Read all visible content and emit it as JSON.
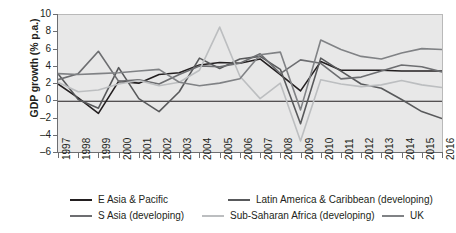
{
  "chart_data": {
    "type": "line",
    "title": "",
    "xlabel": "",
    "ylabel": "GDP growth (% p.a.)",
    "ylim": [
      -6,
      10
    ],
    "yticks": [
      10,
      8,
      6,
      4,
      2,
      0,
      -2,
      -4,
      -6
    ],
    "ytick_labels": [
      "10",
      "8",
      "6",
      "4",
      "2",
      "0",
      "–2",
      "–4",
      "–6"
    ],
    "grid": false,
    "legend_position": "bottom",
    "plot_background": "#e8e8e8",
    "zero_line": 0,
    "categories": [
      "1997",
      "1998",
      "1999",
      "2000",
      "2001",
      "2002",
      "2003",
      "2004",
      "2005",
      "2006",
      "2007",
      "2008",
      "2009",
      "2010",
      "2011",
      "2012",
      "2013",
      "2014",
      "2015",
      "2016"
    ],
    "series": [
      {
        "name": "E Asia & Pacific",
        "color": "#231f20",
        "values": [
          2.0,
          0.4,
          -1.4,
          2.3,
          2.1,
          3.1,
          3.3,
          4.2,
          4.5,
          4.4,
          4.9,
          3.1,
          1.2,
          4.6,
          3.6,
          3.6,
          3.6,
          3.5,
          3.5,
          3.5
        ]
      },
      {
        "name": "Latin America & Caribbean (developing)",
        "color": "#58595b",
        "values": [
          3.2,
          0.2,
          -0.8,
          3.9,
          0.3,
          -1.2,
          1.1,
          5.0,
          3.8,
          4.9,
          5.2,
          3.7,
          -2.6,
          5.0,
          3.5,
          2.0,
          1.5,
          0.2,
          -1.2,
          -2.0
        ]
      },
      {
        "name": "S Asia (developing)",
        "color": "#6d6e71",
        "values": [
          2.5,
          3.2,
          5.8,
          2.3,
          2.5,
          2.0,
          3.1,
          4.1,
          4.0,
          4.4,
          5.5,
          3.2,
          4.8,
          4.4,
          2.6,
          2.8,
          3.5,
          4.2,
          4.0,
          3.4
        ]
      },
      {
        "name": "Sub-Saharan Africa (developing)",
        "color": "#bcbec0",
        "values": [
          2.2,
          1.1,
          1.3,
          2.0,
          2.4,
          1.8,
          2.2,
          3.6,
          8.6,
          2.9,
          0.3,
          2.1,
          -4.6,
          2.5,
          2.0,
          1.7,
          1.9,
          2.4,
          1.9,
          1.6
        ]
      },
      {
        "name": "UK",
        "color": "#808285",
        "values": [
          3.2,
          3.1,
          3.2,
          3.3,
          3.5,
          3.7,
          2.2,
          1.8,
          2.1,
          2.6,
          5.4,
          5.7,
          -1.0,
          7.1,
          6.0,
          5.2,
          4.9,
          5.6,
          6.1,
          6.0
        ]
      }
    ]
  },
  "legend": [
    {
      "label": "E Asia & Pacific",
      "color": "#231f20"
    },
    {
      "label": "Latin America & Caribbean (developing)",
      "color": "#58595b"
    },
    {
      "label": "S Asia (developing)",
      "color": "#6d6e71"
    },
    {
      "label": "Sub-Saharan Africa (developing)",
      "color": "#bcbec0"
    },
    {
      "label": "UK",
      "color": "#808285"
    }
  ]
}
